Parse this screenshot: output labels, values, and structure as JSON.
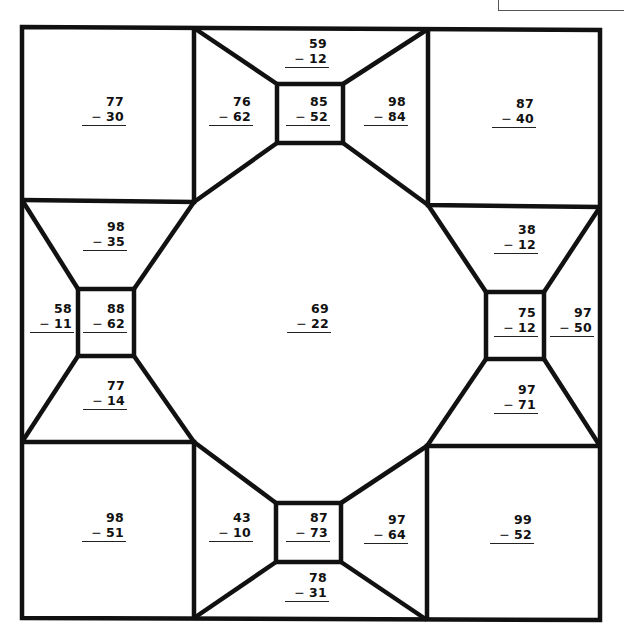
{
  "worksheet": {
    "title": "",
    "name_box_label": "",
    "line_color": "#111111",
    "background": "#ffffff"
  },
  "problems": [
    {
      "id": "top-left-square",
      "minuend": "77",
      "subtrahend": "30",
      "x": 82,
      "y": 94
    },
    {
      "id": "top-left-trapezoid",
      "minuend": "76",
      "subtrahend": "62",
      "x": 209,
      "y": 94
    },
    {
      "id": "top-trapezoid",
      "minuend": "59",
      "subtrahend": "12",
      "x": 285,
      "y": 36
    },
    {
      "id": "top-center-square",
      "minuend": "85",
      "subtrahend": "52",
      "x": 286,
      "y": 94
    },
    {
      "id": "top-right-trapezoid",
      "minuend": "98",
      "subtrahend": "84",
      "x": 364,
      "y": 94
    },
    {
      "id": "top-right-square",
      "minuend": "87",
      "subtrahend": "40",
      "x": 492,
      "y": 96
    },
    {
      "id": "left-top-trapezoid",
      "minuend": "98",
      "subtrahend": "35",
      "x": 83,
      "y": 219
    },
    {
      "id": "left-outer-trapezoid",
      "minuend": "58",
      "subtrahend": "11",
      "x": 30,
      "y": 301
    },
    {
      "id": "left-center-square",
      "minuend": "88",
      "subtrahend": "62",
      "x": 83,
      "y": 301
    },
    {
      "id": "left-bottom-trapezoid",
      "minuend": "77",
      "subtrahend": "14",
      "x": 83,
      "y": 378
    },
    {
      "id": "center-octagon",
      "minuend": "69",
      "subtrahend": "22",
      "x": 287,
      "y": 301
    },
    {
      "id": "right-top-trapezoid",
      "minuend": "38",
      "subtrahend": "12",
      "x": 494,
      "y": 222
    },
    {
      "id": "right-center-square",
      "minuend": "75",
      "subtrahend": "12",
      "x": 494,
      "y": 305
    },
    {
      "id": "right-outer-trapezoid",
      "minuend": "97",
      "subtrahend": "50",
      "x": 550,
      "y": 305
    },
    {
      "id": "right-bottom-trapezoid",
      "minuend": "97",
      "subtrahend": "71",
      "x": 494,
      "y": 382
    },
    {
      "id": "bottom-left-square",
      "minuend": "98",
      "subtrahend": "51",
      "x": 82,
      "y": 510
    },
    {
      "id": "bottom-left-trapezoid",
      "minuend": "43",
      "subtrahend": "10",
      "x": 209,
      "y": 510
    },
    {
      "id": "bottom-center-square",
      "minuend": "87",
      "subtrahend": "73",
      "x": 286,
      "y": 510
    },
    {
      "id": "bottom-trapezoid",
      "minuend": "78",
      "subtrahend": "31",
      "x": 285,
      "y": 570
    },
    {
      "id": "bottom-right-trapezoid",
      "minuend": "97",
      "subtrahend": "64",
      "x": 364,
      "y": 512
    },
    {
      "id": "bottom-right-square",
      "minuend": "99",
      "subtrahend": "52",
      "x": 490,
      "y": 512
    }
  ],
  "operator_symbol": "−"
}
